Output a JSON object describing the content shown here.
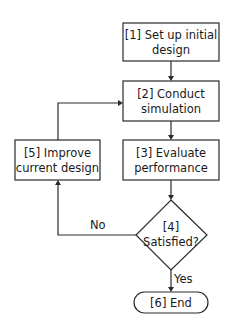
{
  "flowchart": {
    "nodes": {
      "n1": {
        "line1": "[1] Set up initial",
        "line2": "design",
        "shape": "rectangle"
      },
      "n2": {
        "line1": "[2] Conduct",
        "line2": "simulation",
        "shape": "rectangle"
      },
      "n3": {
        "line1": "[3] Evaluate",
        "line2": "performance",
        "shape": "rectangle"
      },
      "n4": {
        "line1": "[4]",
        "line2": "Satisfied?",
        "shape": "diamond"
      },
      "n5": {
        "line1": "[5] Improve",
        "line2": "current design",
        "shape": "rectangle"
      },
      "n6": {
        "line1": "[6] End",
        "shape": "rounded-terminal"
      }
    },
    "edges": [
      {
        "from": "n1",
        "to": "n2",
        "label": ""
      },
      {
        "from": "n2",
        "to": "n3",
        "label": ""
      },
      {
        "from": "n3",
        "to": "n4",
        "label": ""
      },
      {
        "from": "n4",
        "to": "n5",
        "label": "No"
      },
      {
        "from": "n4",
        "to": "n6",
        "label": "Yes"
      },
      {
        "from": "n5",
        "to": "n2",
        "label": ""
      }
    ],
    "labels": {
      "no": "No",
      "yes": "Yes"
    }
  }
}
